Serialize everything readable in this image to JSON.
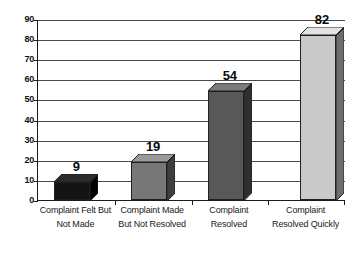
{
  "chart_data": {
    "type": "bar",
    "title": "",
    "subtitle": "",
    "xlabel": "",
    "ylabel": "",
    "categories": [
      "Complaint Felt But Not Made",
      "Complaint Made But Not Resolved",
      "Complaint Resolved",
      "Complaint Resolved Quickly"
    ],
    "category_lines": [
      [
        "Complaint Felt But",
        "Not Made"
      ],
      [
        "Complaint Made",
        "But Not Resolved"
      ],
      [
        "Complaint",
        "Resolved"
      ],
      [
        "Complaint",
        "Resolved Quickly"
      ]
    ],
    "values": [
      9,
      19,
      54,
      82
    ],
    "value_labels": [
      "9",
      "19",
      "54",
      "82"
    ],
    "ylim": [
      0,
      90
    ],
    "ytick_step": 10,
    "yticks": [
      0,
      10,
      20,
      30,
      40,
      50,
      60,
      70,
      80,
      90
    ],
    "ytick_labels": [
      "0",
      "10",
      "20",
      "30",
      "40",
      "50",
      "60",
      "70",
      "80",
      "90"
    ],
    "grid": true,
    "legend": false,
    "legend_position": "none",
    "bar_style": "3d-column",
    "bar_colors": [
      "#141414",
      "#777777",
      "#585858",
      "#c9c9c9"
    ],
    "bar_side_colors": [
      "#000000",
      "#3e3e3e",
      "#2f2f2f",
      "#6e6e6e"
    ],
    "bar_top_colors": [
      "#2b2b2b",
      "#9a9a9a",
      "#7a7a7a",
      "#e2e2e2"
    ],
    "axis_color": "#1b1b1b",
    "gridline_color": "#4a4a4a",
    "background_color": "#ffffff"
  },
  "axes": {
    "y_axis_name": "value-axis",
    "x_axis_name": "category-axis"
  }
}
